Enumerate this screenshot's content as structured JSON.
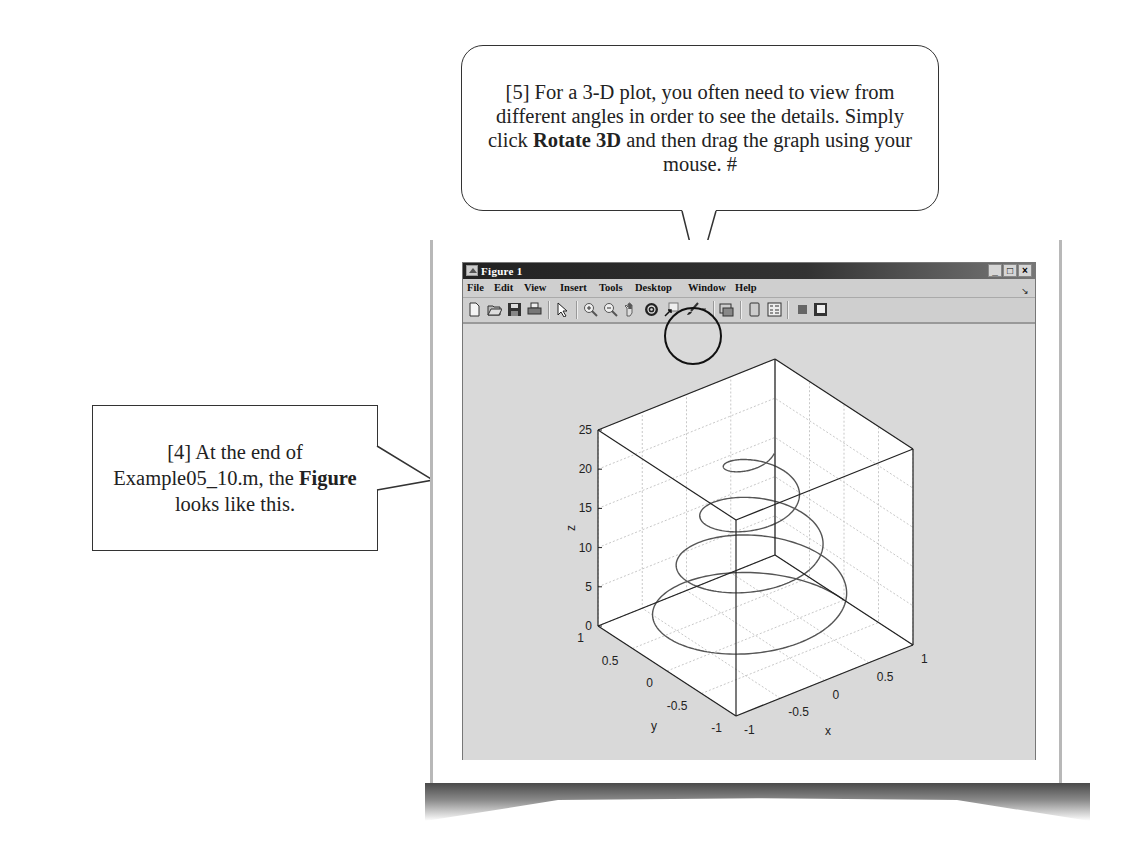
{
  "callouts": {
    "top": {
      "text_a": "[5] For a 3-D plot, you often need to view from different angles in order to see the details.  Simply click ",
      "bold": "Rotate 3D",
      "text_b": " and then drag the graph using your mouse.  #"
    },
    "left": {
      "text_a": "[4] At the end of Example05_10.m, the ",
      "bold": "Figure",
      "text_b": " looks like this."
    }
  },
  "window": {
    "title": "Figure 1",
    "controls": {
      "minimize": "_",
      "maximize": "□",
      "close": "×"
    },
    "menu": [
      "File",
      "Edit",
      "View",
      "Insert",
      "Tools",
      "Desktop",
      "Window",
      "Help"
    ],
    "dock_icon": "dock-arrow-icon",
    "toolbar": [
      {
        "name": "new-figure-icon"
      },
      {
        "name": "open-file-icon"
      },
      {
        "name": "save-figure-icon"
      },
      {
        "name": "print-figure-icon"
      },
      {
        "sep": true
      },
      {
        "name": "edit-plot-icon"
      },
      {
        "sep": true
      },
      {
        "name": "zoom-in-icon"
      },
      {
        "name": "zoom-out-icon"
      },
      {
        "name": "pan-icon"
      },
      {
        "name": "rotate-3d-icon",
        "highlighted": true
      },
      {
        "name": "data-cursor-icon"
      },
      {
        "name": "brush-icon"
      },
      {
        "name": "brush-dropdown-icon"
      },
      {
        "sep": true
      },
      {
        "name": "link-plot-icon"
      },
      {
        "sep": true
      },
      {
        "name": "insert-colorbar-icon"
      },
      {
        "name": "insert-legend-icon"
      },
      {
        "sep": true
      },
      {
        "name": "hide-plot-tools-icon"
      },
      {
        "name": "show-plot-tools-icon"
      }
    ]
  },
  "chart_data": {
    "type": "line3d",
    "title": "",
    "xlabel": "x",
    "ylabel": "y",
    "zlabel": "z",
    "xlim": [
      -1,
      1
    ],
    "ylim": [
      -1,
      1
    ],
    "zlim": [
      0,
      25
    ],
    "xticks": [
      "-1",
      "-0.5",
      "0",
      "0.5",
      "1"
    ],
    "yticks": [
      "-1",
      "-0.5",
      "0",
      "0.5",
      "1"
    ],
    "zticks": [
      "0",
      "5",
      "10",
      "15",
      "20",
      "25"
    ],
    "grid": true,
    "series": [
      {
        "name": "helix",
        "description": "conical helix, radius shrinking with height",
        "t_range": [
          0,
          24
        ],
        "z": "t",
        "r_start": 1.0,
        "r_end": 0.2,
        "turns": 3.8
      }
    ]
  },
  "colors": {
    "figure_bg": "#d9d9d9",
    "axes_bg": "#ffffff",
    "line": "#555555",
    "grid": "#c8c8c8"
  }
}
